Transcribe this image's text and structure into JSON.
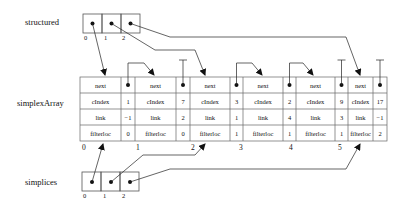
{
  "labels": {
    "structured": "structured",
    "simplexArray": "simplexArray",
    "simplices": "simplices"
  },
  "structured": {
    "indices": [
      "0",
      "1",
      "2"
    ]
  },
  "simplices": {
    "indices": [
      "0",
      "1",
      "2"
    ]
  },
  "simplexArray": {
    "row_labels": [
      "next",
      "cIndex",
      "link",
      "filterloc"
    ],
    "entries": [
      {
        "index": "0",
        "next": "•",
        "cIndex": "1",
        "link": "−1",
        "filterloc": "0"
      },
      {
        "index": "1",
        "next": "⊥",
        "cIndex": "7",
        "link": "2",
        "filterloc": "0"
      },
      {
        "index": "2",
        "next": "•",
        "cIndex": "3",
        "link": "1",
        "filterloc": "1"
      },
      {
        "index": "3",
        "next": "•",
        "cIndex": "2",
        "link": "4",
        "filterloc": "1"
      },
      {
        "index": "4",
        "next": "⊥",
        "cIndex": "9",
        "link": "3",
        "filterloc": "1"
      },
      {
        "index": "5",
        "next": "⊥",
        "cIndex": "17",
        "link": "−1",
        "filterloc": "2"
      }
    ]
  }
}
